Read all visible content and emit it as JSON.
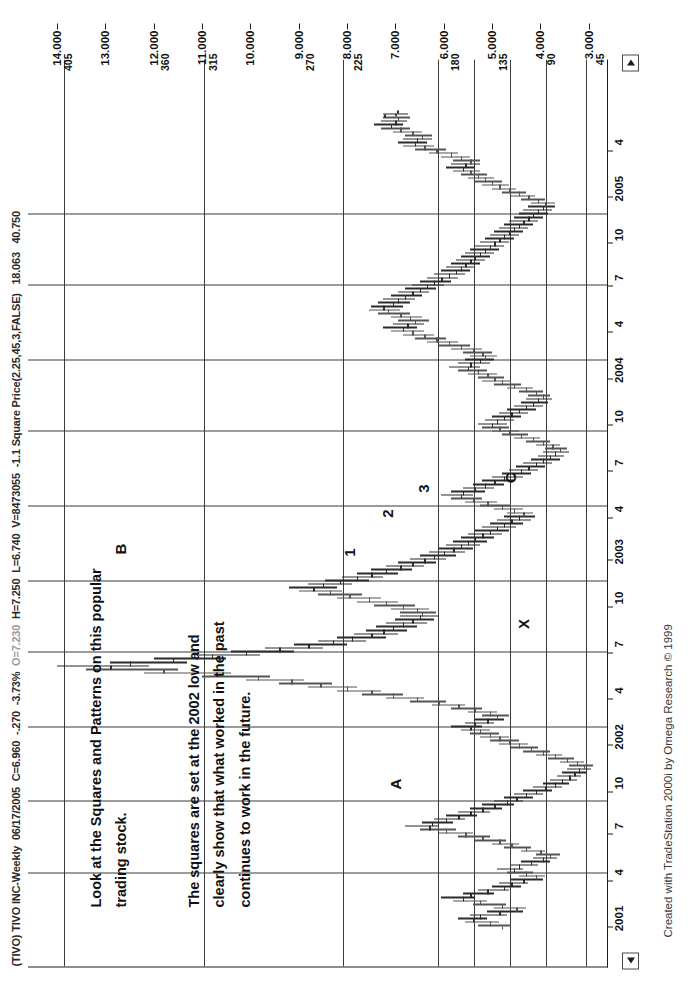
{
  "window": {
    "title_symbol": "(TIVO) TIVO INC-Weekly",
    "title_date": "06/17/2005",
    "title_close": "C=6.960",
    "title_change": "-.270",
    "title_change_pct": "-3.73%",
    "title_open": "O=7.230",
    "title_high": "H=7.250",
    "title_low": "L=6.740",
    "title_volume": "V=8473055",
    "indicator": "-1.1 Square Price(2.25,45,3,FALSE)",
    "indicator_val1": "18.063",
    "indicator_val2": "40.750"
  },
  "credit": "Created with TradeStation 2000i by Omega Research © 1999",
  "annotations": [
    {
      "name": "note-top",
      "text": "Look at the Squares and Patterns on this popular\ntrading stock."
    },
    {
      "name": "note-bottom",
      "text": "The squares are set at the 2002 low and\nclearly show that what worked in the past\ncontinues to work in the future."
    }
  ],
  "point_labels": [
    {
      "text": "A",
      "x": 17.5,
      "y": 7.0
    },
    {
      "text": "B",
      "x": 46.5,
      "y": 12.7
    },
    {
      "text": "C",
      "x": 55.0,
      "y": 4.62
    },
    {
      "text": "X",
      "x": 37.0,
      "y": 4.35
    },
    {
      "text": "1",
      "x": 46.0,
      "y": 7.95
    },
    {
      "text": "2",
      "x": 50.5,
      "y": 7.18
    },
    {
      "text": "3",
      "x": 53.5,
      "y": 6.42
    }
  ],
  "chart_data": {
    "type": "ohlc",
    "title": "(TIVO) TIVO INC-Weekly",
    "xlabel": "",
    "ylabel": "Price",
    "ylim": [
      2.6,
      14.6
    ],
    "grid": true,
    "legend": "none",
    "price_axis_ticks": [
      "14.000",
      "13.000",
      "12.000",
      "11.000",
      "10.000",
      "9.000",
      "8.000",
      "7.000",
      "6.000",
      "5.000",
      "4.000",
      "3.000"
    ],
    "square_axis_ticks": [
      "405",
      "360",
      "315",
      "270",
      "225",
      "180",
      "135",
      "90",
      "45"
    ],
    "square_axis_values": [
      14.0,
      12.0,
      11.0,
      9.0,
      8.0,
      6.0,
      5.0,
      4.0,
      3.0
    ],
    "date_axis_ticks": [
      "2001",
      "4",
      "7",
      "10",
      "2002",
      "4",
      "7",
      "10",
      "2003",
      "4",
      "7",
      "10",
      "2004",
      "4",
      "7",
      "10",
      "2005",
      "4"
    ],
    "horizontal_square_lines": [
      3.05,
      3.88,
      4.62,
      5.37,
      6.12,
      8.08,
      10.96,
      13.85
    ],
    "vertical_square_lines": [
      6.5,
      15.5,
      24.5,
      33.5,
      42.5,
      51.5,
      60.5,
      69.5,
      78.5,
      87.5
    ],
    "series_name": "TIVO weekly OHLC",
    "bars": [
      [
        4.8,
        5.3,
        4.6,
        5.05
      ],
      [
        5.05,
        5.55,
        4.85,
        5.4
      ],
      [
        5.4,
        5.7,
        5.1,
        5.25
      ],
      [
        5.25,
        5.45,
        4.7,
        4.85
      ],
      [
        4.85,
        5.1,
        4.35,
        4.5
      ],
      [
        4.5,
        4.95,
        4.3,
        4.8
      ],
      [
        4.8,
        5.4,
        4.7,
        5.25
      ],
      [
        5.25,
        5.8,
        5.1,
        5.6
      ],
      [
        5.6,
        6.05,
        5.35,
        5.45
      ],
      [
        5.45,
        5.6,
        4.95,
        5.1
      ],
      [
        5.1,
        5.3,
        4.65,
        4.75
      ],
      [
        4.75,
        5.0,
        4.4,
        4.6
      ],
      [
        4.6,
        4.85,
        4.25,
        4.35
      ],
      [
        4.35,
        4.6,
        3.95,
        4.1
      ],
      [
        4.1,
        4.45,
        3.9,
        4.3
      ],
      [
        4.3,
        4.7,
        4.15,
        4.55
      ],
      [
        4.55,
        4.9,
        4.35,
        4.45
      ],
      [
        4.45,
        4.6,
        4.05,
        4.2
      ],
      [
        4.2,
        4.4,
        3.8,
        3.95
      ],
      [
        3.95,
        4.15,
        3.65,
        3.8
      ],
      [
        3.8,
        4.1,
        3.6,
        4.0
      ],
      [
        4.0,
        4.4,
        3.9,
        4.3
      ],
      [
        4.3,
        4.75,
        4.2,
        4.6
      ],
      [
        4.6,
        5.0,
        4.45,
        4.85
      ],
      [
        4.85,
        5.35,
        4.7,
        5.2
      ],
      [
        5.2,
        5.7,
        5.05,
        5.55
      ],
      [
        5.55,
        6.1,
        5.4,
        5.95
      ],
      [
        5.95,
        6.5,
        5.75,
        6.3
      ],
      [
        6.3,
        6.8,
        6.1,
        6.25
      ],
      [
        6.25,
        6.45,
        5.8,
        5.95
      ],
      [
        5.95,
        6.2,
        5.55,
        5.7
      ],
      [
        5.7,
        5.95,
        5.3,
        5.45
      ],
      [
        5.45,
        5.7,
        5.05,
        5.2
      ],
      [
        5.2,
        5.45,
        4.8,
        4.95
      ],
      [
        4.95,
        5.2,
        4.55,
        4.7
      ],
      [
        4.7,
        4.95,
        4.35,
        4.5
      ],
      [
        4.5,
        4.75,
        4.15,
        4.3
      ],
      [
        4.3,
        4.55,
        3.95,
        4.1
      ],
      [
        4.1,
        4.35,
        3.75,
        3.9
      ],
      [
        3.9,
        4.15,
        3.55,
        3.7
      ],
      [
        3.7,
        3.95,
        3.4,
        3.55
      ],
      [
        3.55,
        3.8,
        3.25,
        3.4
      ],
      [
        3.4,
        3.65,
        3.15,
        3.3
      ],
      [
        3.3,
        3.55,
        3.05,
        3.2
      ],
      [
        3.2,
        3.45,
        2.95,
        3.1
      ],
      [
        3.1,
        3.4,
        2.9,
        3.25
      ],
      [
        3.25,
        3.6,
        3.1,
        3.45
      ],
      [
        3.45,
        3.85,
        3.3,
        3.7
      ],
      [
        3.7,
        4.1,
        3.55,
        3.95
      ],
      [
        3.95,
        4.35,
        3.8,
        4.2
      ],
      [
        4.2,
        4.6,
        4.05,
        4.45
      ],
      [
        4.45,
        4.85,
        4.25,
        4.65
      ],
      [
        4.65,
        5.05,
        4.45,
        4.85
      ],
      [
        4.85,
        5.25,
        4.65,
        5.05
      ],
      [
        5.05,
        5.45,
        4.85,
        5.25
      ],
      [
        5.25,
        5.65,
        5.05,
        5.45
      ],
      [
        5.45,
        5.85,
        5.2,
        5.35
      ],
      [
        5.35,
        5.55,
        4.95,
        5.1
      ],
      [
        5.1,
        5.35,
        4.75,
        4.9
      ],
      [
        4.9,
        5.2,
        4.65,
        5.05
      ],
      [
        5.05,
        5.5,
        4.9,
        5.35
      ],
      [
        5.35,
        5.85,
        5.2,
        5.7
      ],
      [
        5.7,
        6.25,
        5.55,
        6.1
      ],
      [
        6.1,
        6.7,
        5.95,
        6.55
      ],
      [
        6.55,
        7.2,
        6.4,
        7.05
      ],
      [
        7.05,
        7.7,
        6.85,
        7.5
      ],
      [
        7.5,
        8.2,
        7.3,
        8.0
      ],
      [
        8.0,
        8.8,
        7.8,
        8.55
      ],
      [
        8.55,
        9.4,
        8.3,
        9.15
      ],
      [
        9.15,
        10.1,
        8.9,
        9.85
      ],
      [
        9.85,
        11.0,
        9.6,
        10.7
      ],
      [
        10.7,
        12.2,
        10.4,
        11.8
      ],
      [
        11.8,
        13.4,
        11.5,
        12.9
      ],
      [
        12.9,
        14.0,
        12.1,
        12.5
      ],
      [
        12.5,
        12.9,
        11.3,
        11.6
      ],
      [
        11.6,
        12.0,
        10.5,
        10.8
      ],
      [
        10.8,
        11.1,
        9.8,
        10.1
      ],
      [
        10.1,
        10.4,
        9.1,
        9.4
      ],
      [
        9.4,
        9.7,
        8.5,
        8.8
      ],
      [
        8.8,
        9.1,
        8.0,
        8.3
      ],
      [
        8.3,
        8.6,
        7.6,
        7.9
      ],
      [
        7.9,
        8.2,
        7.2,
        7.5
      ],
      [
        7.5,
        7.85,
        6.95,
        7.25
      ],
      [
        7.25,
        7.6,
        6.75,
        7.05
      ],
      [
        7.05,
        7.4,
        6.55,
        6.85
      ],
      [
        6.85,
        7.2,
        6.35,
        6.65
      ],
      [
        6.65,
        7.0,
        6.2,
        6.5
      ],
      [
        6.5,
        6.9,
        6.1,
        6.45
      ],
      [
        6.45,
        6.9,
        6.15,
        6.55
      ],
      [
        6.55,
        7.1,
        6.3,
        6.85
      ],
      [
        6.85,
        7.45,
        6.6,
        7.2
      ],
      [
        7.2,
        7.8,
        6.95,
        7.55
      ],
      [
        7.55,
        8.2,
        7.3,
        7.95
      ],
      [
        7.95,
        8.6,
        7.7,
        8.35
      ],
      [
        8.35,
        9.0,
        8.1,
        8.7
      ],
      [
        8.7,
        9.2,
        8.2,
        8.5
      ],
      [
        8.5,
        8.8,
        7.9,
        8.15
      ],
      [
        8.15,
        8.45,
        7.55,
        7.8
      ],
      [
        7.8,
        8.1,
        7.25,
        7.5
      ],
      [
        7.5,
        7.8,
        6.95,
        7.2
      ],
      [
        7.2,
        7.5,
        6.65,
        6.9
      ],
      [
        6.9,
        7.2,
        6.4,
        6.65
      ],
      [
        6.65,
        6.95,
        6.15,
        6.4
      ],
      [
        6.4,
        6.7,
        5.95,
        6.2
      ],
      [
        6.2,
        6.5,
        5.75,
        6.0
      ],
      [
        6.0,
        6.3,
        5.55,
        5.8
      ],
      [
        5.8,
        6.1,
        5.4,
        5.65
      ],
      [
        5.65,
        5.95,
        5.25,
        5.5
      ],
      [
        5.5,
        5.8,
        5.1,
        5.35
      ],
      [
        5.35,
        5.65,
        4.95,
        5.2
      ],
      [
        5.2,
        5.5,
        4.8,
        5.05
      ],
      [
        5.05,
        5.35,
        4.65,
        4.9
      ],
      [
        4.9,
        5.2,
        4.5,
        4.75
      ],
      [
        4.75,
        5.05,
        4.35,
        4.6
      ],
      [
        4.6,
        4.9,
        4.2,
        4.45
      ],
      [
        4.45,
        4.75,
        4.1,
        4.35
      ],
      [
        4.35,
        4.7,
        4.15,
        4.55
      ],
      [
        4.55,
        4.95,
        4.35,
        4.8
      ],
      [
        4.8,
        5.25,
        4.6,
        5.1
      ],
      [
        5.1,
        5.55,
        4.9,
        5.4
      ],
      [
        5.4,
        5.85,
        5.2,
        5.65
      ],
      [
        5.65,
        6.05,
        5.4,
        5.6
      ],
      [
        5.6,
        5.85,
        5.15,
        5.35
      ],
      [
        5.35,
        5.6,
        4.95,
        5.15
      ],
      [
        5.15,
        5.4,
        4.75,
        4.95
      ],
      [
        4.95,
        5.2,
        4.55,
        4.75
      ],
      [
        4.75,
        5.0,
        4.35,
        4.55
      ],
      [
        4.55,
        4.8,
        4.2,
        4.4
      ],
      [
        4.4,
        4.65,
        4.05,
        4.25
      ],
      [
        4.25,
        4.5,
        3.9,
        4.1
      ],
      [
        4.1,
        4.35,
        3.75,
        3.95
      ],
      [
        3.95,
        4.2,
        3.6,
        3.8
      ],
      [
        3.8,
        4.05,
        3.5,
        3.7
      ],
      [
        3.7,
        3.95,
        3.4,
        3.6
      ],
      [
        3.6,
        3.9,
        3.45,
        3.75
      ],
      [
        3.75,
        4.1,
        3.6,
        3.95
      ],
      [
        3.95,
        4.3,
        3.8,
        4.15
      ],
      [
        4.15,
        4.55,
        4.0,
        4.4
      ],
      [
        4.4,
        4.8,
        4.25,
        4.65
      ],
      [
        4.65,
        5.0,
        4.45,
        4.85
      ],
      [
        4.85,
        5.2,
        4.65,
        5.0
      ],
      [
        5.0,
        5.3,
        4.7,
        4.9
      ],
      [
        4.9,
        5.15,
        4.55,
        4.75
      ],
      [
        4.75,
        5.0,
        4.4,
        4.6
      ],
      [
        4.6,
        4.85,
        4.25,
        4.45
      ],
      [
        4.45,
        4.7,
        4.1,
        4.3
      ],
      [
        4.3,
        4.55,
        3.95,
        4.15
      ],
      [
        4.15,
        4.4,
        3.85,
        4.05
      ],
      [
        4.05,
        4.3,
        3.75,
        3.95
      ],
      [
        3.95,
        4.25,
        3.8,
        4.1
      ],
      [
        4.1,
        4.45,
        3.95,
        4.3
      ],
      [
        4.3,
        4.7,
        4.15,
        4.55
      ],
      [
        4.55,
        4.95,
        4.4,
        4.8
      ],
      [
        4.8,
        5.2,
        4.6,
        4.95
      ],
      [
        4.95,
        5.3,
        4.75,
        5.1
      ],
      [
        5.1,
        5.5,
        4.9,
        5.3
      ],
      [
        5.3,
        5.7,
        5.1,
        5.5
      ],
      [
        5.5,
        5.9,
        5.25,
        5.45
      ],
      [
        5.45,
        5.7,
        5.05,
        5.25
      ],
      [
        5.25,
        5.55,
        4.95,
        5.15
      ],
      [
        5.15,
        5.45,
        4.9,
        5.2
      ],
      [
        5.2,
        5.6,
        5.0,
        5.4
      ],
      [
        5.4,
        5.85,
        5.2,
        5.65
      ],
      [
        5.65,
        6.1,
        5.45,
        5.9
      ],
      [
        5.9,
        6.35,
        5.7,
        6.15
      ],
      [
        6.15,
        6.6,
        5.95,
        6.4
      ],
      [
        6.4,
        6.85,
        6.2,
        6.65
      ],
      [
        6.65,
        7.1,
        6.4,
        6.85
      ],
      [
        6.85,
        7.25,
        6.55,
        6.75
      ],
      [
        6.75,
        7.05,
        6.4,
        6.6
      ],
      [
        6.6,
        6.95,
        6.3,
        6.7
      ],
      [
        6.7,
        7.1,
        6.45,
        6.9
      ],
      [
        6.9,
        7.35,
        6.7,
        7.15
      ],
      [
        7.15,
        7.55,
        6.9,
        7.25
      ],
      [
        7.25,
        7.5,
        6.85,
        7.05
      ],
      [
        7.05,
        7.35,
        6.7,
        6.95
      ],
      [
        6.95,
        7.25,
        6.6,
        6.8
      ],
      [
        6.8,
        7.1,
        6.45,
        6.65
      ],
      [
        6.65,
        6.95,
        6.3,
        6.5
      ],
      [
        6.5,
        6.8,
        6.15,
        6.35
      ],
      [
        6.35,
        6.65,
        6.0,
        6.2
      ],
      [
        6.2,
        6.5,
        5.85,
        6.05
      ],
      [
        6.05,
        6.35,
        5.7,
        5.9
      ],
      [
        5.9,
        6.2,
        5.55,
        5.75
      ],
      [
        5.75,
        6.05,
        5.45,
        5.65
      ],
      [
        5.65,
        5.95,
        5.35,
        5.55
      ],
      [
        5.55,
        5.85,
        5.25,
        5.45
      ],
      [
        5.45,
        5.75,
        5.15,
        5.35
      ],
      [
        5.35,
        5.65,
        5.05,
        5.25
      ],
      [
        5.25,
        5.55,
        4.95,
        5.15
      ],
      [
        5.15,
        5.45,
        4.85,
        5.05
      ],
      [
        5.05,
        5.35,
        4.75,
        4.95
      ],
      [
        4.95,
        5.25,
        4.65,
        4.85
      ],
      [
        4.85,
        5.15,
        4.55,
        4.75
      ],
      [
        4.75,
        5.05,
        4.45,
        4.65
      ],
      [
        4.65,
        4.95,
        4.35,
        4.55
      ],
      [
        4.55,
        4.85,
        4.25,
        4.45
      ],
      [
        4.45,
        4.75,
        4.15,
        4.35
      ],
      [
        4.35,
        4.65,
        4.05,
        4.25
      ],
      [
        4.25,
        4.55,
        3.95,
        4.15
      ],
      [
        4.15,
        4.45,
        3.85,
        4.05
      ],
      [
        4.05,
        4.35,
        3.75,
        3.95
      ],
      [
        3.95,
        4.25,
        3.7,
        3.9
      ],
      [
        3.9,
        4.2,
        3.7,
        4.05
      ],
      [
        4.05,
        4.4,
        3.9,
        4.25
      ],
      [
        4.25,
        4.6,
        4.1,
        4.45
      ],
      [
        4.45,
        4.8,
        4.3,
        4.65
      ],
      [
        4.65,
        5.0,
        4.5,
        4.85
      ],
      [
        4.85,
        5.2,
        4.65,
        5.0
      ],
      [
        5.0,
        5.35,
        4.8,
        5.15
      ],
      [
        5.15,
        5.5,
        4.95,
        5.3
      ],
      [
        5.3,
        5.65,
        5.1,
        5.45
      ],
      [
        5.45,
        5.8,
        5.25,
        5.6
      ],
      [
        5.6,
        5.95,
        5.35,
        5.55
      ],
      [
        5.55,
        5.85,
        5.25,
        5.45
      ],
      [
        5.45,
        5.8,
        5.25,
        5.65
      ],
      [
        5.65,
        6.05,
        5.45,
        5.85
      ],
      [
        5.85,
        6.3,
        5.7,
        6.15
      ],
      [
        6.15,
        6.6,
        5.95,
        6.4
      ],
      [
        6.4,
        6.85,
        6.2,
        6.6
      ],
      [
        6.6,
        6.95,
        6.35,
        6.55
      ],
      [
        6.55,
        6.85,
        6.25,
        6.45
      ],
      [
        6.45,
        6.8,
        6.25,
        6.65
      ],
      [
        6.65,
        7.05,
        6.45,
        6.9
      ],
      [
        6.9,
        7.3,
        6.7,
        7.1
      ],
      [
        7.1,
        7.45,
        6.85,
        7.0
      ],
      [
        7.0,
        7.3,
        6.75,
        6.95
      ],
      [
        6.95,
        7.25,
        6.7,
        7.0
      ],
      [
        7.23,
        7.25,
        6.74,
        6.96
      ]
    ]
  }
}
